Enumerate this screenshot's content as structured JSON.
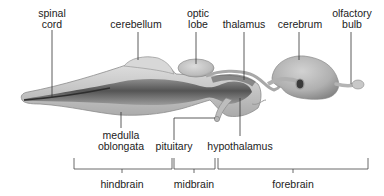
{
  "diagram": {
    "structures": [
      {
        "id": "spinal-cord",
        "label_lines": [
          "spinal",
          "cord"
        ]
      },
      {
        "id": "cerebellum",
        "label_lines": [
          "cerebellum"
        ]
      },
      {
        "id": "optic-lobe",
        "label_lines": [
          "optic",
          "lobe"
        ]
      },
      {
        "id": "thalamus",
        "label_lines": [
          "thalamus"
        ]
      },
      {
        "id": "cerebrum",
        "label_lines": [
          "cerebrum"
        ]
      },
      {
        "id": "olfactory-bulb",
        "label_lines": [
          "olfactory",
          "bulb"
        ]
      },
      {
        "id": "medulla-oblongata",
        "label_lines": [
          "medulla",
          "oblongata"
        ]
      },
      {
        "id": "pituitary",
        "label_lines": [
          "pituitary"
        ]
      },
      {
        "id": "hypothalamus",
        "label_lines": [
          "hypothalamus"
        ]
      }
    ],
    "regions": [
      {
        "id": "hindbrain",
        "label": "hindbrain"
      },
      {
        "id": "midbrain",
        "label": "midbrain"
      },
      {
        "id": "forebrain",
        "label": "forebrain"
      }
    ]
  },
  "colors": {
    "tissue_light": "#d6d6d6",
    "tissue_mid": "#b4b4b4",
    "tissue_dark": "#6e6e6e",
    "line": "#333333",
    "text": "#222222"
  }
}
